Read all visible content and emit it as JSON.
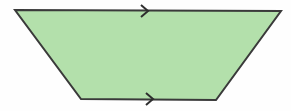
{
  "canvas": {
    "width": 291,
    "height": 111,
    "background_color": "#fefefe",
    "title": "Trapezoid with parallel side markers"
  },
  "figure": {
    "name": "trapezoid",
    "shape_type": "isosceles-trapezoid",
    "fill_color": "#b3e0ab",
    "stroke_color": "#3a3a3a",
    "stroke_width": 2,
    "vertices": [
      {
        "label": "top-left",
        "x": 15,
        "y": 10
      },
      {
        "label": "top-right",
        "x": 281,
        "y": 11
      },
      {
        "label": "bottom-right",
        "x": 216,
        "y": 100
      },
      {
        "label": "bottom-left",
        "x": 81,
        "y": 99
      }
    ],
    "points_path": "15,10 281,11 216,100 81,99"
  },
  "markers": [
    {
      "name": "top-parallel-arrow",
      "glyph": "chevron-right-icon",
      "edge": "top",
      "direction": "right",
      "tick_count": 1,
      "center_x": 145,
      "center_y": 11,
      "color": "#2e2e2e",
      "path": "M 141 5 L 148 11 L 141 17"
    },
    {
      "name": "bottom-parallel-arrow",
      "glyph": "chevron-right-icon",
      "edge": "bottom",
      "direction": "right",
      "tick_count": 1,
      "center_x": 150,
      "center_y": 99,
      "color": "#2e2e2e",
      "path": "M 146 93 L 153 99 L 146 105"
    }
  ]
}
